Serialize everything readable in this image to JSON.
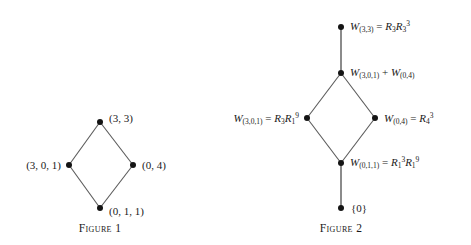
{
  "figures": [
    {
      "id": "figure-1",
      "caption": "Figure 1",
      "nodes": [
        {
          "id": "f1-top",
          "label": "(3, 3)",
          "side": "right"
        },
        {
          "id": "f1-left",
          "label": "(3, 0, 1)",
          "side": "left"
        },
        {
          "id": "f1-right",
          "label": "(0, 4)",
          "side": "right"
        },
        {
          "id": "f1-bottom",
          "label": "(0, 1, 1)",
          "side": "right"
        }
      ]
    },
    {
      "id": "figure-2",
      "caption": "Figure 2",
      "nodes": [
        {
          "id": "f2-top",
          "label": "W(3,3) = R3R3^3",
          "side": "right"
        },
        {
          "id": "f2-sum",
          "label": "W(3,0,1) + W(0,4)",
          "side": "right"
        },
        {
          "id": "f2-left",
          "label": "W(3,0,1) = R3R1^9",
          "side": "left"
        },
        {
          "id": "f2-right",
          "label": "W(0,4) = R4^3",
          "side": "right"
        },
        {
          "id": "f2-bottom",
          "label": "W(0,1,1) = R1^3R1^9",
          "side": "right"
        },
        {
          "id": "f2-zero",
          "label": "{0}",
          "side": "right"
        }
      ]
    }
  ],
  "fig1": {
    "caption": "Figure 1",
    "top_label": "(3, 3)",
    "left_label": "(3, 0, 1)",
    "right_label": "(0, 4)",
    "bottom_label": "(0, 1, 1)"
  },
  "fig2": {
    "caption": "Figure 2",
    "top": {
      "w": "W",
      "wsub": "(3,3)",
      "eq": " = ",
      "r1": "R",
      "r1sub": "3",
      "r2": "R",
      "r2sub": "3",
      "r2sup": "3"
    },
    "sum": {
      "w1": "W",
      "w1sub": "(3,0,1)",
      "plus": " + ",
      "w2": "W",
      "w2sub": "(0,4)"
    },
    "left": {
      "w": "W",
      "wsub": "(3,0,1)",
      "eq": " = ",
      "r1": "R",
      "r1sub": "3",
      "r2": "R",
      "r2sub": "1",
      "r2sup": "9"
    },
    "right": {
      "w": "W",
      "wsub": "(0,4)",
      "eq": " = ",
      "r1": "R",
      "r1sub": "4",
      "r1sup": "3"
    },
    "bottom": {
      "w": "W",
      "wsub": "(0,1,1)",
      "eq": " = ",
      "r1": "R",
      "r1sub": "1",
      "r1sup": "3",
      "r2": "R",
      "r2sub": "1",
      "r2sup": "9"
    },
    "zero": {
      "text": "{0}"
    }
  },
  "colors": {
    "ink": "#1a1a1a",
    "node": "#141414",
    "edge": "#5a5a5a",
    "background": "#ffffff"
  }
}
